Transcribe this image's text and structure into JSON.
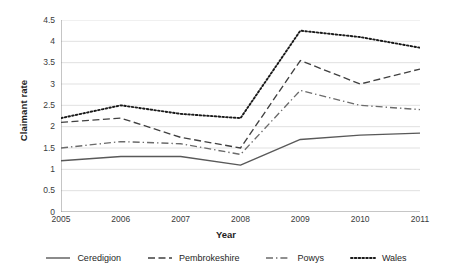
{
  "chart_data": {
    "type": "line",
    "title": "",
    "xlabel": "Year",
    "ylabel": "Claimant rate",
    "categories": [
      "2005",
      "2006",
      "2007",
      "2008",
      "2009",
      "2010",
      "2011"
    ],
    "x": [
      2005,
      2006,
      2007,
      2008,
      2009,
      2010,
      2011
    ],
    "xlim": [
      2005,
      2011
    ],
    "ylim": [
      0,
      4.5
    ],
    "ytick_labels": [
      "0",
      "0.5",
      "1",
      "1.5",
      "2",
      "2.5",
      "3",
      "3.5",
      "4",
      "4.5"
    ],
    "ytick_values": [
      0,
      0.5,
      1,
      1.5,
      2,
      2.5,
      3,
      3.5,
      4,
      4.5
    ],
    "grid": "horizontal",
    "legend_position": "bottom",
    "series": [
      {
        "name": "Ceredigion",
        "dash": "solid",
        "color": "#595959",
        "values": [
          1.2,
          1.3,
          1.3,
          1.1,
          1.7,
          1.8,
          1.85
        ]
      },
      {
        "name": "Pembrokeshire",
        "dash": "dashed",
        "color": "#404040",
        "values": [
          2.1,
          2.2,
          1.75,
          1.5,
          3.55,
          3.0,
          3.35
        ]
      },
      {
        "name": "Powys",
        "dash": "dashdot",
        "color": "#6b6b6b",
        "values": [
          1.5,
          1.65,
          1.6,
          1.35,
          2.85,
          2.5,
          2.4
        ]
      },
      {
        "name": "Wales",
        "dash": "dotted",
        "color": "#1a1a1a",
        "values": [
          2.2,
          2.5,
          2.3,
          2.2,
          4.25,
          4.1,
          3.85
        ]
      }
    ]
  },
  "legend": {
    "items": [
      {
        "label": "Ceredigion"
      },
      {
        "label": "Pembrokeshire"
      },
      {
        "label": "Powys"
      },
      {
        "label": "Wales"
      }
    ]
  }
}
